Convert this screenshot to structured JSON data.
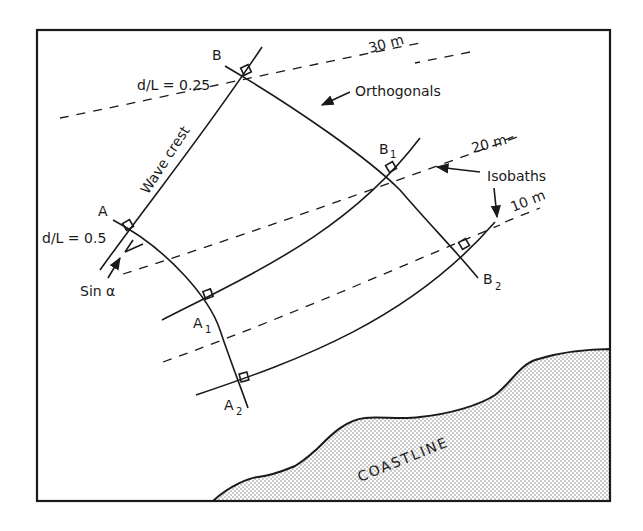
{
  "figure": {
    "labels": {
      "B": "B",
      "B1": "B",
      "B1_sub": "1",
      "B2": "B",
      "B2_sub": "2",
      "A": "A",
      "A1": "A",
      "A1_sub": "1",
      "A2": "A",
      "A2_sub": "2",
      "d_over_L_025": "d/L = 0.25",
      "d_over_L_05": "d/L = 0.5",
      "wave_crest": "Wave crest",
      "orthogonals": "Orthogonals",
      "isobaths": "Isobaths",
      "sin_alpha": "Sin α",
      "coastline": "COASTLINE"
    },
    "isobaths": [
      {
        "depth": "30 m"
      },
      {
        "depth": "20 m"
      },
      {
        "depth": "10 m"
      }
    ],
    "colors": {
      "ink": "#1a1a1a",
      "background": "#ffffff",
      "land_stipple": "#9a9a9a"
    }
  }
}
